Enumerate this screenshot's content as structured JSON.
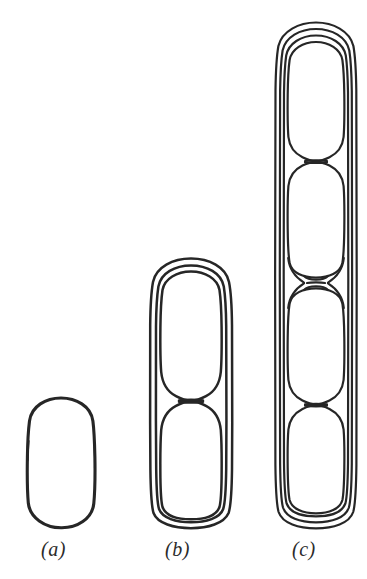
{
  "figure": {
    "caption_style": "italic-parenthetical",
    "background_color": "#ffffff",
    "ink_color": "#262626",
    "panels": [
      {
        "id": "a",
        "label": "(a)",
        "description": "single rod-shaped bacterial cell, one envelope layer",
        "cell_count": 1,
        "envelope_layers": 1,
        "septa": 0
      },
      {
        "id": "b",
        "label": "(b)",
        "description": "two-celled chain with constriction, double envelope layer",
        "cell_count": 2,
        "envelope_layers": 2,
        "septa": 1
      },
      {
        "id": "c",
        "label": "(c)",
        "description": "four-celled chain with central division septum, triple envelope layer",
        "cell_count": 4,
        "envelope_layers": 3,
        "septa": 3
      }
    ]
  },
  "labels": {
    "a": "(a)",
    "b": "(b)",
    "c": "(c)"
  }
}
